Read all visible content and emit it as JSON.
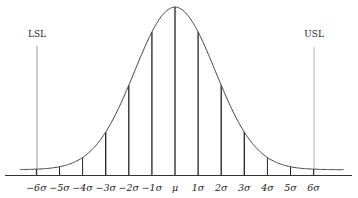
{
  "chart_data": {
    "type": "line",
    "title": "",
    "xlabel": "",
    "ylabel": "",
    "tick_labels": [
      "−6σ",
      "−5σ",
      "−4σ",
      "−3σ",
      "−2σ",
      "−1σ",
      "μ",
      "1σ",
      "2σ",
      "3σ",
      "4σ",
      "5σ",
      "6σ"
    ],
    "x": [
      -6,
      -5,
      -4,
      -3,
      -2,
      -1,
      0,
      1,
      2,
      3,
      4,
      5,
      6
    ],
    "annotations": [
      {
        "label": "LSL",
        "x": -6
      },
      {
        "label": "USL",
        "x": 6
      }
    ],
    "grid": false,
    "colors": {
      "curve": "#444444",
      "lines": "#222222",
      "spec_limits": "#999999"
    }
  },
  "labels": {
    "lsl": "LSL",
    "usl": "USL"
  }
}
